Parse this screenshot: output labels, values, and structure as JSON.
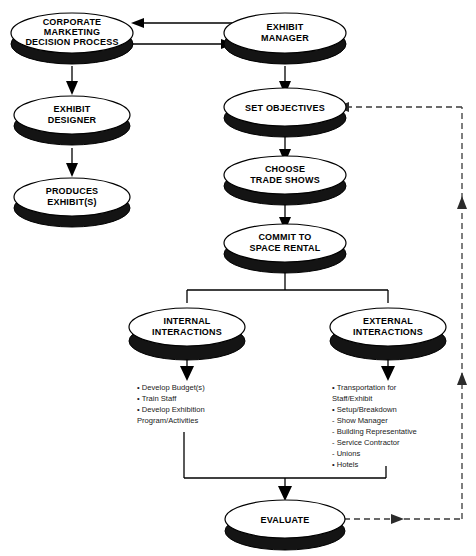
{
  "diagram": {
    "background_color": "#ffffff",
    "node_fill": "#ffffff",
    "node_stroke": "#000000",
    "shadow_color": "#141414"
  },
  "nodes": {
    "corporate_marketing": {
      "id": "corporate-marketing-decision-process",
      "lines": [
        "CORPORATE",
        "MARKETING",
        "DECISION PROCESS"
      ]
    },
    "exhibit_manager": {
      "id": "exhibit-manager",
      "lines": [
        "EXHIBIT",
        "MANAGER"
      ]
    },
    "exhibit_designer": {
      "id": "exhibit-designer",
      "lines": [
        "EXHIBIT",
        "DESIGNER"
      ]
    },
    "produces_exhibits": {
      "id": "produces-exhibits",
      "lines": [
        "PRODUCES",
        "EXHIBIT(S)"
      ]
    },
    "set_objectives": {
      "id": "set-objectives",
      "lines": [
        "SET OBJECTIVES"
      ]
    },
    "choose_trade_shows": {
      "id": "choose-trade-shows",
      "lines": [
        "CHOOSE",
        "TRADE SHOWS"
      ]
    },
    "commit_space_rental": {
      "id": "commit-to-space-rental",
      "lines": [
        "COMMIT TO",
        "SPACE RENTAL"
      ]
    },
    "internal_interactions": {
      "id": "internal-interactions",
      "lines": [
        "INTERNAL",
        "INTERACTIONS"
      ]
    },
    "external_interactions": {
      "id": "external-interactions",
      "lines": [
        "EXTERNAL",
        "INTERACTIONS"
      ]
    },
    "evaluate": {
      "id": "evaluate",
      "lines": [
        "EVALUATE"
      ]
    }
  },
  "internal_list": {
    "name": "internal-interactions-task-list",
    "items": [
      "• Develop Budget(s)",
      "• Train Staff",
      "• Develop Exhibition",
      "   Program/Activities"
    ]
  },
  "external_list": {
    "name": "external-interactions-task-list",
    "items": [
      "• Transportation for",
      "   Staff/Exhibit",
      "• Setup/Breakdown",
      "   - Show Manager",
      "   - Building Representative",
      "   - Service Contractor",
      "   - Unions",
      "• Hotels"
    ]
  },
  "connectors": [
    {
      "name": "manager-to-corporate-arrow",
      "style": "solid",
      "direction": "left"
    },
    {
      "name": "corporate-to-manager-arrow",
      "style": "solid",
      "direction": "right"
    },
    {
      "name": "corporate-to-designer-arrow",
      "style": "solid",
      "direction": "down"
    },
    {
      "name": "designer-to-produces-arrow",
      "style": "solid",
      "direction": "down"
    },
    {
      "name": "manager-to-objectives-arrow",
      "style": "solid",
      "direction": "down"
    },
    {
      "name": "objectives-to-choose-arrow",
      "style": "solid",
      "direction": "down"
    },
    {
      "name": "choose-to-commit-arrow",
      "style": "solid",
      "direction": "down"
    },
    {
      "name": "commit-to-internal-arrow",
      "style": "solid",
      "direction": "down"
    },
    {
      "name": "commit-to-external-arrow",
      "style": "solid",
      "direction": "down"
    },
    {
      "name": "internal-to-list-arrow",
      "style": "solid",
      "direction": "down"
    },
    {
      "name": "external-to-list-arrow",
      "style": "solid",
      "direction": "down"
    },
    {
      "name": "lists-to-evaluate-arrow",
      "style": "solid",
      "direction": "down"
    },
    {
      "name": "evaluate-feedback-arrow",
      "style": "dashed",
      "direction": "right"
    },
    {
      "name": "feedback-loop-up",
      "style": "dashed",
      "direction": "up"
    },
    {
      "name": "feedback-to-objectives-arrow",
      "style": "dashed",
      "direction": "left"
    }
  ]
}
